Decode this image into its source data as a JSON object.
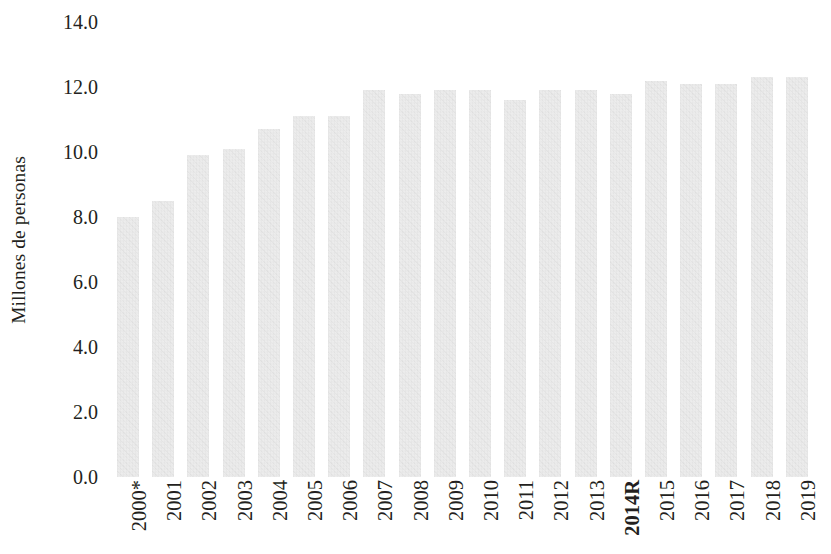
{
  "chart_data": {
    "type": "bar",
    "title": "",
    "subtitle": "",
    "xlabel": "",
    "ylabel": "Millones de personas",
    "ylim": [
      0.0,
      14.0
    ],
    "ytick_step": 2.0,
    "ytick_labels": [
      "14.0",
      "12.0",
      "10.0",
      "8.0",
      "6.0",
      "4.0",
      "2.0",
      "0.0"
    ],
    "ytick_values": [
      14.0,
      12.0,
      10.0,
      8.0,
      6.0,
      4.0,
      2.0,
      0.0
    ],
    "grid": false,
    "legend": null,
    "legend_position": "none",
    "bar_color": "#e8e8e8",
    "categories": [
      "2000*",
      "2001",
      "2002",
      "2003",
      "2004",
      "2005",
      "2006",
      "2007",
      "2008",
      "2009",
      "2010",
      "2011",
      "2012",
      "2013",
      "2014R",
      "2015",
      "2016",
      "2017",
      "2018",
      "2019"
    ],
    "emphasized_categories": [
      "2014R"
    ],
    "values": [
      8.0,
      8.5,
      9.9,
      10.1,
      10.7,
      11.1,
      11.1,
      11.9,
      11.8,
      11.9,
      11.9,
      11.6,
      11.9,
      11.9,
      11.8,
      12.2,
      12.1,
      12.1,
      12.3,
      12.3
    ],
    "series": [
      {
        "name": "Millones de personas",
        "values": [
          8.0,
          8.5,
          9.9,
          10.1,
          10.7,
          11.1,
          11.1,
          11.9,
          11.8,
          11.9,
          11.9,
          11.6,
          11.9,
          11.9,
          11.8,
          12.2,
          12.1,
          12.1,
          12.3,
          12.3
        ]
      }
    ],
    "annotations": []
  }
}
